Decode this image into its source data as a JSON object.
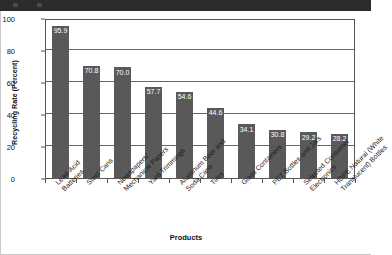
{
  "window": {
    "chrome_color": "#2b2b2b"
  },
  "chart_data": {
    "type": "bar",
    "title": "",
    "xlabel": "Products",
    "ylabel": "Recycling Rate (Percent)",
    "ylim": [
      0,
      100
    ],
    "yticks": [
      0,
      20,
      40,
      60,
      80,
      100
    ],
    "ytick_labels": [
      "0",
      "20",
      "40",
      "60",
      "80",
      "100"
    ],
    "grid": true,
    "legend": "none",
    "bar_color": "#595959",
    "label_color": "#ffffff",
    "categories": [
      "Lead-Acid Batteries",
      "Steel Cans",
      "Newspapers/Mechanical Papers",
      "Yard Trimmings",
      "Aluminum Beer and Soda Cans",
      "Tires",
      "Glass Containers",
      "PET Bottles and Jars",
      "Selected Consumer Electronics",
      "HDPE Natural (White Translucent) Bottles"
    ],
    "category_lines": [
      [
        "Lead-Acid",
        "Batteries"
      ],
      [
        "Steel Cans"
      ],
      [
        "Newspapers/",
        "Mechanical Papers"
      ],
      [
        "Yard Trimmings"
      ],
      [
        "Aluminum Beer and",
        "Soda Cans"
      ],
      [
        "Tires"
      ],
      [
        "Glass Containers"
      ],
      [
        "PET Bottles and Jars"
      ],
      [
        "Selected Consumer",
        "Electronics"
      ],
      [
        "HDPE Natural (White",
        "Translucent) Bottles"
      ]
    ],
    "values": [
      95.9,
      70.8,
      70.0,
      57.7,
      54.6,
      44.6,
      34.1,
      30.8,
      29.2,
      28.2
    ],
    "value_labels": [
      "95.9",
      "70.8",
      "70.0",
      "57.7",
      "54.6",
      "44.6",
      "34.1",
      "30.8",
      "29.2",
      "28.2"
    ]
  }
}
